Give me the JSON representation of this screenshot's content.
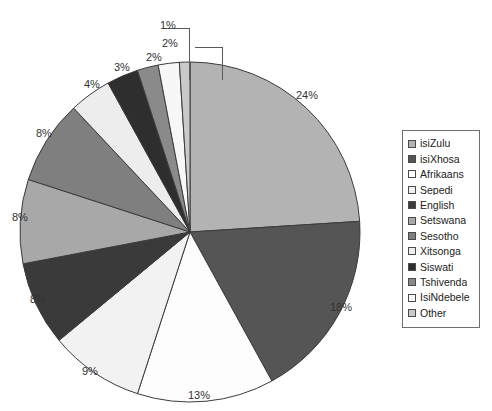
{
  "title_remnant": "",
  "chart_data": {
    "type": "pie",
    "title": "",
    "xlabel": "",
    "ylabel": "",
    "legend_position": "right",
    "grid": false,
    "start_angle_deg": 0,
    "direction": "clockwise",
    "categories": [
      "isiZulu",
      "isiXhosa",
      "Afrikaans",
      "Sepedi",
      "English",
      "Setswana",
      "Sesotho",
      "Xitsonga",
      "Siswati",
      "Tshivenda",
      "IsiNdebele",
      "Other"
    ],
    "values": [
      24,
      18,
      13,
      9,
      8,
      8,
      8,
      4,
      3,
      2,
      2,
      1
    ],
    "data_labels": [
      "24%",
      "18%",
      "13%",
      "9%",
      "8%",
      "8%",
      "8%",
      "4%",
      "3%",
      "2%",
      "2%",
      "1%"
    ],
    "colors": [
      "#b3b3b3",
      "#555555",
      "#fdfdfd",
      "#f2f2f2",
      "#3a3a3a",
      "#a8a8a8",
      "#7f7f7f",
      "#ededed",
      "#2e2e2e",
      "#8a8a8a",
      "#f7f7f7",
      "#c9c9c9"
    ],
    "slice_border_color": "#3b3b3b",
    "leader_lines": [
      "2%",
      "1%"
    ]
  },
  "legend": {
    "items": [
      {
        "label": "isiZulu",
        "color": "#b3b3b3"
      },
      {
        "label": "isiXhosa",
        "color": "#555555"
      },
      {
        "label": "Afrikaans",
        "color": "#fdfdfd"
      },
      {
        "label": "Sepedi",
        "color": "#f2f2f2"
      },
      {
        "label": "English",
        "color": "#3a3a3a"
      },
      {
        "label": "Setswana",
        "color": "#a8a8a8"
      },
      {
        "label": "Sesotho",
        "color": "#7f7f7f"
      },
      {
        "label": "Xitsonga",
        "color": "#ededed"
      },
      {
        "label": "Siswati",
        "color": "#2e2e2e"
      },
      {
        "label": "Tshivenda",
        "color": "#8a8a8a"
      },
      {
        "label": "IsiNdebele",
        "color": "#f7f7f7"
      },
      {
        "label": "Other",
        "color": "#c9c9c9"
      }
    ]
  },
  "labels_positioned": [
    {
      "text": "24%",
      "left": 296,
      "top": 90
    },
    {
      "text": "18%",
      "left": 330,
      "top": 302
    },
    {
      "text": "13%",
      "left": 188,
      "top": 390
    },
    {
      "text": "9%",
      "left": 82,
      "top": 366
    },
    {
      "text": "8%",
      "left": 30,
      "top": 294
    },
    {
      "text": "8%",
      "left": 12,
      "top": 212
    },
    {
      "text": "8%",
      "left": 36,
      "top": 128
    },
    {
      "text": "4%",
      "left": 84,
      "top": 79
    },
    {
      "text": "3%",
      "left": 114,
      "top": 62
    },
    {
      "text": "2%",
      "left": 146,
      "top": 52
    },
    {
      "text": "2%",
      "left": 162,
      "top": 38
    },
    {
      "text": "1%",
      "left": 160,
      "top": 20
    }
  ]
}
